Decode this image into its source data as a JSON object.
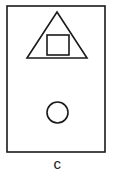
{
  "figure": {
    "label": "c",
    "background_color": "#ffffff",
    "stroke_color": "#1a1a1a",
    "frame": {
      "name": "outer-rectangle",
      "x": 7,
      "y": 6,
      "width": 98,
      "height": 146,
      "stroke_width": 1.6
    },
    "shapes": [
      {
        "name": "triangle",
        "type": "triangle",
        "apex": [
          57,
          12
        ],
        "base_left": [
          27,
          58
        ],
        "base_right": [
          87,
          58
        ],
        "stroke_width": 1.6
      },
      {
        "name": "inner-square",
        "type": "square",
        "x": 47,
        "y": 35,
        "width": 22,
        "height": 20,
        "stroke_width": 1.6
      },
      {
        "name": "circle",
        "type": "circle",
        "center": [
          57.5,
          112.5
        ],
        "radius": 10.5,
        "stroke_width": 1.6
      }
    ]
  }
}
